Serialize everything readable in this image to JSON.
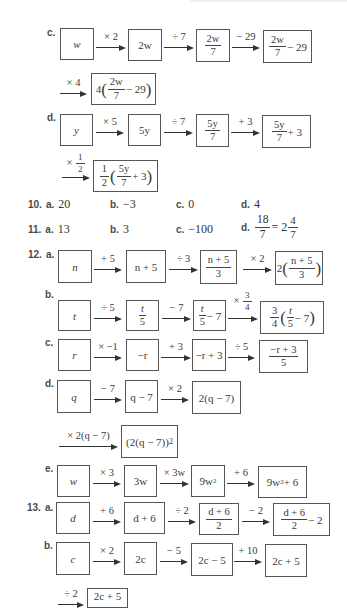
{
  "problems": {
    "p9c": {
      "label": "c.",
      "start": "w",
      "steps": [
        {
          "op": "× 2",
          "result": "2w"
        },
        {
          "op": "÷ 7",
          "result": "2w/7"
        },
        {
          "op": "− 29",
          "result": "2w/7 − 29"
        },
        {
          "op": "× 4",
          "result": "4(2w/7 − 29)"
        }
      ]
    },
    "p9d": {
      "label": "d.",
      "start": "y",
      "steps": [
        {
          "op": "× 5",
          "result": "5y"
        },
        {
          "op": "÷ 7",
          "result": "5y/7"
        },
        {
          "op": "+ 3",
          "result": "5y/7 + 3"
        },
        {
          "op": "× 1/2",
          "result": "1/2(5y/7 + 3)"
        }
      ]
    },
    "p10": {
      "number": "10.",
      "answers": [
        {
          "key": "a.",
          "value": "20"
        },
        {
          "key": "b.",
          "value": "−3"
        },
        {
          "key": "c.",
          "value": "0"
        },
        {
          "key": "d.",
          "value": "4"
        }
      ]
    },
    "p11": {
      "number": "11.",
      "answers": [
        {
          "key": "a.",
          "value": "13"
        },
        {
          "key": "b.",
          "value": "3"
        },
        {
          "key": "c.",
          "value": "−100"
        },
        {
          "key": "d.",
          "value": "18/7 = 2 4/7"
        }
      ]
    },
    "p12": {
      "number": "12.",
      "a": {
        "label": "a.",
        "start": "n",
        "steps": [
          {
            "op": "+ 5",
            "result": "n + 5"
          },
          {
            "op": "÷ 3",
            "result": "(n + 5)/3"
          },
          {
            "op": "× 2",
            "result": "2((n + 5)/3)"
          }
        ]
      },
      "b": {
        "label": "b.",
        "start": "t",
        "steps": [
          {
            "op": "÷ 5",
            "result": "t/5"
          },
          {
            "op": "− 7",
            "result": "t/5 − 7"
          },
          {
            "op": "× 3/4",
            "result": "3/4(t/5 − 7)"
          }
        ]
      },
      "c": {
        "label": "c.",
        "start": "r",
        "steps": [
          {
            "op": "× −1",
            "result": "−r"
          },
          {
            "op": "+ 3",
            "result": "−r + 3"
          },
          {
            "op": "÷ 5",
            "result": "(−r + 3)/5"
          }
        ]
      },
      "d": {
        "label": "d.",
        "start": "q",
        "steps": [
          {
            "op": "− 7",
            "result": "q − 7"
          },
          {
            "op": "× 2",
            "result": "2(q − 7)"
          },
          {
            "op": "× 2(q − 7)",
            "result": "(2(q − 7))²"
          }
        ]
      },
      "e": {
        "label": "e.",
        "start": "w",
        "steps": [
          {
            "op": "× 3",
            "result": "3w"
          },
          {
            "op": "× 3w",
            "result": "9w²"
          },
          {
            "op": "+ 6",
            "result": "9w² + 6"
          }
        ]
      }
    },
    "p13": {
      "number": "13.",
      "a": {
        "label": "a.",
        "start": "d",
        "steps": [
          {
            "op": "+ 6",
            "result": "d + 6"
          },
          {
            "op": "÷ 2",
            "result": "(d + 6)/2"
          },
          {
            "op": "− 2",
            "result": "(d + 6)/2 − 2"
          }
        ]
      },
      "b": {
        "label": "b.",
        "start": "c",
        "steps": [
          {
            "op": "× 2",
            "result": "2c"
          },
          {
            "op": "− 5",
            "result": "2c − 5"
          },
          {
            "op": "+ 10",
            "result": "2c + 5"
          },
          {
            "op": "÷ 2",
            "result": "2c + 5"
          }
        ]
      }
    }
  },
  "text": {
    "w": "w",
    "y": "y",
    "n": "n",
    "t": "t",
    "r": "r",
    "q": "q",
    "d": "d",
    "c": "c",
    "two": "2",
    "three": "3",
    "four": "4",
    "five": "5",
    "seven": "7",
    "one": "1",
    "2w": "2w",
    "5y": "5y",
    "m29": " − 29",
    "p3": " + 3",
    "m7": " − 7",
    "m2": " − 2",
    "n5": "n + 5",
    "d6": "d + 6",
    "mr": "−r",
    "mr3": "−r + 3",
    "q7": "q − 7",
    "2q7": "2(q − 7)",
    "2q7sq": "(2(q − 7))",
    "sq": "2",
    "3w": "3w",
    "9w": "9w",
    "9w6tail": " + 6",
    "2c": "2c",
    "2c5m": "2c − 5",
    "2c5p": "2c + 5",
    "eq": " = 2",
    "lp": "(",
    "rp": ")"
  }
}
